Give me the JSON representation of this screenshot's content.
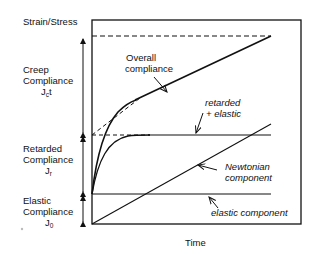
{
  "diagram": {
    "y_axis_label": "Strain/Stress",
    "x_axis_label": "Time",
    "left_labels": {
      "creep": {
        "line1": "Creep",
        "line2": "Compliance",
        "symbol": "J",
        "sub": "c",
        "suffix": "t"
      },
      "retarded": {
        "line1": "Retarded",
        "line2": "Compliance",
        "symbol": "J",
        "sub": "r"
      },
      "elastic": {
        "line1": "Elastic",
        "line2": "Compliance",
        "symbol": "J",
        "sub": "0"
      }
    },
    "annotations": {
      "overall": {
        "line1": "Overall",
        "line2": "compliance"
      },
      "retarded_elastic": {
        "line1": "retarded",
        "line2": "+ elastic"
      },
      "newtonian": {
        "line1": "Newtonian",
        "line2": "component"
      },
      "elastic": "elastic component"
    },
    "colors": {
      "line": "#111111",
      "background": "#ffffff"
    }
  }
}
